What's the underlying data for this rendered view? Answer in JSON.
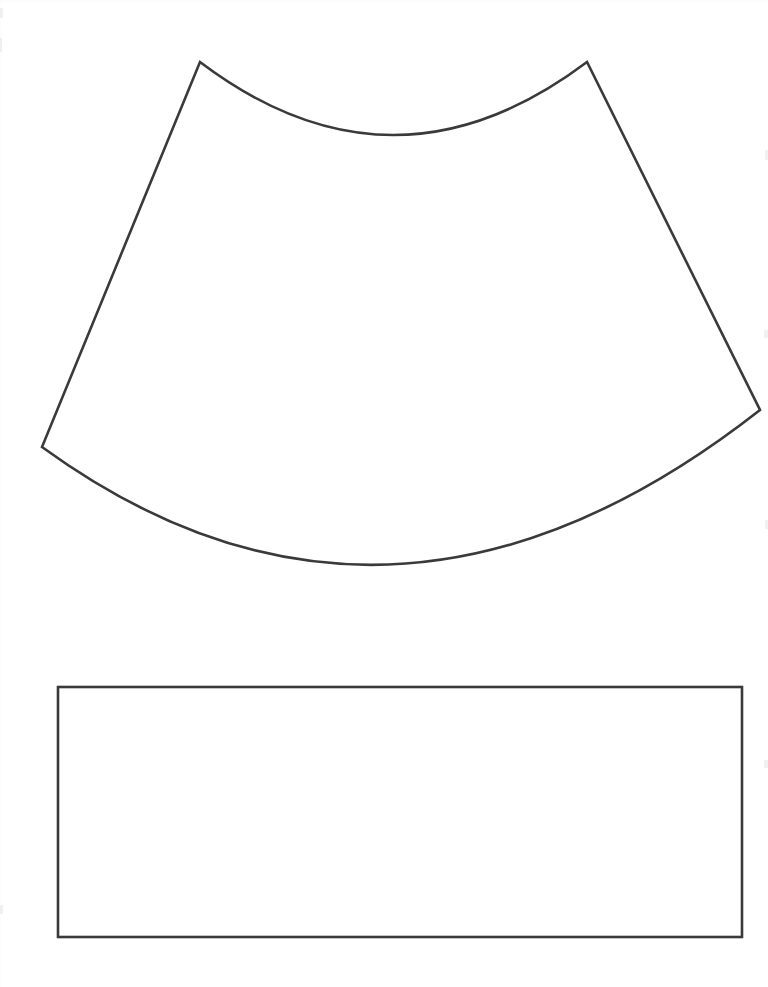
{
  "document": {
    "title": "Pattern Template Sheet",
    "page_width": 768,
    "page_height": 987,
    "background_color": "#ffffff",
    "ink_color": "#3a3a3a",
    "stroke_width": 2.6
  },
  "shapes": [
    {
      "name": "annular-sector-pattern",
      "label": "Curved trapezoid pattern piece",
      "type": "closed-path",
      "fill": "none",
      "stroke": "#3a3a3a",
      "stroke_width": 2.6,
      "vertices": {
        "top_left_apex": [
          200,
          62
        ],
        "top_right_apex": [
          587,
          62
        ],
        "left_corner": [
          42,
          447
        ],
        "right_corner": [
          760,
          410
        ]
      },
      "arcs": {
        "top_concave": {
          "from": [
            200,
            62
          ],
          "to": [
            587,
            62
          ],
          "lowest_point": [
            393,
            147
          ],
          "direction": "concave-down-dip"
        },
        "bottom_convex": {
          "from": [
            42,
            447
          ],
          "to": [
            760,
            410
          ],
          "lowest_point": [
            375,
            645
          ],
          "direction": "convex-bulge-down"
        }
      },
      "path_d": "M 200 62 Q 393 208 587 62 L 760 410 Q 390 700 42 447 Z"
    },
    {
      "name": "rectangle-pattern",
      "label": "Rectangular pattern piece",
      "type": "rectangle",
      "fill": "none",
      "stroke": "#3a3a3a",
      "stroke_width": 2.6,
      "x": 58,
      "y": 687,
      "width": 684,
      "height": 250,
      "corners": {
        "top_left": [
          58,
          687
        ],
        "top_right": [
          742,
          687
        ],
        "bottom_right": [
          742,
          937
        ],
        "bottom_left": [
          58,
          937
        ]
      }
    }
  ]
}
